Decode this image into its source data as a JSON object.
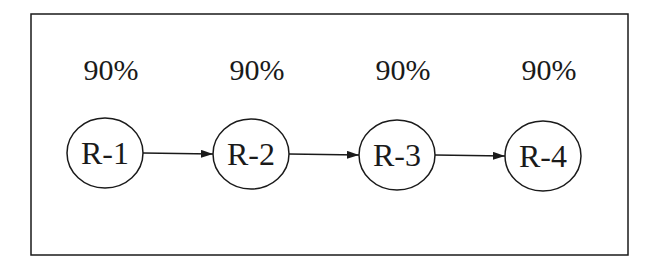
{
  "diagram": {
    "frame": {
      "x": 31,
      "y": 14,
      "w": 597,
      "h": 241
    },
    "nodes": [
      {
        "id": "R-1",
        "label": "R-1",
        "percent": "90%",
        "cx": 105,
        "cy": 153
      },
      {
        "id": "R-2",
        "label": "R-2",
        "percent": "90%",
        "cx": 251,
        "cy": 154
      },
      {
        "id": "R-3",
        "label": "R-3",
        "percent": "90%",
        "cx": 397,
        "cy": 155
      },
      {
        "id": "R-4",
        "label": "R-4",
        "percent": "90%",
        "cx": 543,
        "cy": 156
      }
    ],
    "edges": [
      {
        "from": "R-1",
        "to": "R-2"
      },
      {
        "from": "R-2",
        "to": "R-3"
      },
      {
        "from": "R-3",
        "to": "R-4"
      }
    ],
    "colors": {
      "stroke": "#1a1a1a",
      "background": "#ffffff"
    }
  }
}
